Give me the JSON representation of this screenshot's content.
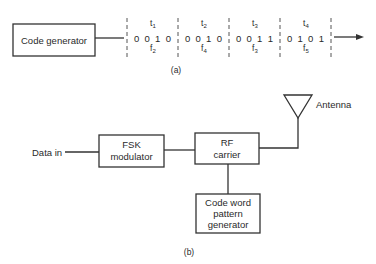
{
  "part_a": {
    "label": "(a)",
    "code_generator_label": "Code generator",
    "segments": [
      {
        "time": "t",
        "time_sub": "1",
        "bits": "0  0  1  0",
        "freq": "f",
        "freq_sub": "2"
      },
      {
        "time": "t",
        "time_sub": "2",
        "bits": "0  0  1  0",
        "freq": "f",
        "freq_sub": "4"
      },
      {
        "time": "t",
        "time_sub": "3",
        "bits": "0  0  1  1",
        "freq": "f",
        "freq_sub": "3"
      },
      {
        "time": "t",
        "time_sub": "4",
        "bits": "0  1  0  1",
        "freq": "f",
        "freq_sub": "5"
      }
    ]
  },
  "part_b": {
    "label": "(b)",
    "data_in_label": "Data in",
    "fsk_line1": "FSK",
    "fsk_line2": "modulator",
    "rf_line1": "RF",
    "rf_line2": "carrier",
    "codeword_line1": "Code word",
    "codeword_line2": "pattern",
    "codeword_line3": "generator",
    "antenna_label": "Antenna"
  },
  "icons": {
    "arrow": "right-arrow-icon",
    "antenna": "antenna-triangle-icon"
  }
}
